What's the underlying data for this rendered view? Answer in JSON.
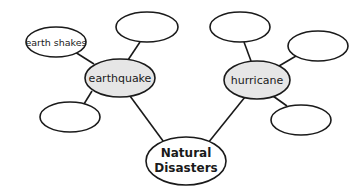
{
  "diagram": {
    "type": "concept-web",
    "colors": {
      "line": "#1a1a1a",
      "center_fill": "#ffffff",
      "category_fill": "#e6e6e6",
      "leaf_fill": "#ffffff"
    },
    "center": {
      "label_line1": "Natural",
      "label_line2": "Disasters"
    },
    "categories": [
      {
        "label": "earthquake",
        "details": [
          "earth shakes",
          "",
          ""
        ]
      },
      {
        "label": "hurricane",
        "details": [
          "",
          "",
          ""
        ]
      }
    ]
  }
}
